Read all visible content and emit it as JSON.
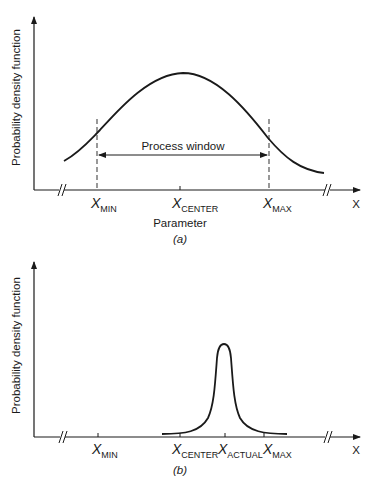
{
  "figure": {
    "panels": [
      {
        "id": "a",
        "caption": "(a)",
        "y_axis_label": "Probability density function",
        "x_axis_label": "Parameter",
        "x_axis_end_label": "X",
        "annotation": "Process window",
        "ticks": [
          {
            "var": "X",
            "sub": "MIN"
          },
          {
            "var": "X",
            "sub": "CENTER"
          },
          {
            "var": "X",
            "sub": "MAX"
          }
        ]
      },
      {
        "id": "b",
        "caption": "(b)",
        "y_axis_label": "Probability density function",
        "x_axis_end_label": "X",
        "ticks": [
          {
            "var": "X",
            "sub": "MIN"
          },
          {
            "var": "X",
            "sub": "CENTER"
          },
          {
            "var": "X",
            "sub": "ACTUAL"
          },
          {
            "var": "X",
            "sub": "MAX"
          }
        ]
      }
    ],
    "colors": {
      "ink": "#1a1a1a",
      "dash": "#555555",
      "background": "#ffffff"
    }
  }
}
